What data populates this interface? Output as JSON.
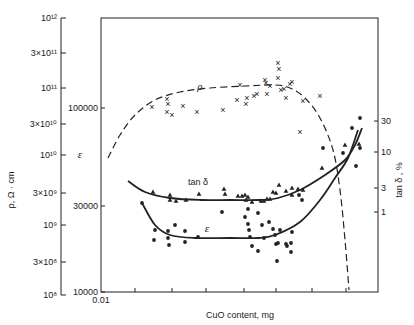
{
  "chart_data": {
    "type": "scatter",
    "title": "",
    "xlabel": "CuO content, mg",
    "x_scale": "log",
    "x_ticks": [
      {
        "label": "0.01",
        "x": 101
      }
    ],
    "axes": {
      "rho": {
        "label": "ρ, Ω · cm",
        "scale": "log",
        "range": [
          100000000.0,
          1000000000000.0
        ],
        "ticks": [
          {
            "label": "10¹²",
            "y": 18
          },
          {
            "label": "3×10¹¹",
            "y": 53
          },
          {
            "label": "10¹¹",
            "y": 88
          },
          {
            "label": "3×10¹⁰",
            "y": 124
          },
          {
            "label": "10¹⁰",
            "y": 155
          },
          {
            "label": "3×10⁹",
            "y": 193
          },
          {
            "label": "10⁹",
            "y": 225
          },
          {
            "label": "3×10⁸",
            "y": 262
          },
          {
            "label": "10⁸",
            "y": 295
          }
        ]
      },
      "epsilon": {
        "label": "ε",
        "scale": "log",
        "range": [
          10000,
          300000
        ],
        "ticks": [
          {
            "label": "100000",
            "y": 108
          },
          {
            "label": "30000",
            "y": 206
          },
          {
            "label": "10000",
            "y": 292
          }
        ]
      },
      "tan_delta": {
        "label": "tan δ , %",
        "scale": "log",
        "ticks": [
          {
            "label": "30",
            "y": 121
          },
          {
            "label": "10",
            "y": 152
          },
          {
            "label": "3",
            "y": 188
          },
          {
            "label": "1",
            "y": 212
          }
        ]
      }
    },
    "series": [
      {
        "name": "ρ",
        "marker": "x",
        "line": "dashed",
        "curve_label": "ρ",
        "curve": [
          [
            108,
            158
          ],
          [
            120,
            135
          ],
          [
            135,
            115
          ],
          [
            155,
            100
          ],
          [
            180,
            92
          ],
          [
            210,
            88
          ],
          [
            245,
            86
          ],
          [
            275,
            85
          ],
          [
            290,
            88
          ],
          [
            305,
            98
          ],
          [
            320,
            118
          ],
          [
            333,
            150
          ],
          [
            340,
            190
          ],
          [
            345,
            240
          ],
          [
            349,
            290
          ]
        ],
        "points": [
          [
            152,
            107
          ],
          [
            167,
            99
          ],
          [
            168,
            104
          ],
          [
            167,
            112
          ],
          [
            172,
            115
          ],
          [
            183,
            106
          ],
          [
            197,
            112
          ],
          [
            223,
            110
          ],
          [
            240,
            85
          ],
          [
            237,
            100
          ],
          [
            247,
            98
          ],
          [
            246,
            104
          ],
          [
            254,
            96
          ],
          [
            257,
            94
          ],
          [
            265,
            80
          ],
          [
            266,
            83
          ],
          [
            267,
            94
          ],
          [
            270,
            86
          ],
          [
            278,
            63
          ],
          [
            279,
            69
          ],
          [
            278,
            78
          ],
          [
            281,
            90
          ],
          [
            284,
            89
          ],
          [
            286,
            98
          ],
          [
            290,
            84
          ],
          [
            292,
            82
          ],
          [
            303,
            101
          ],
          [
            300,
            132
          ],
          [
            320,
            96
          ]
        ]
      },
      {
        "name": "tan δ",
        "marker": "triangle",
        "line": "solid",
        "curve_label": "tan δ",
        "curve": [
          [
            128,
            181
          ],
          [
            145,
            192
          ],
          [
            170,
            198
          ],
          [
            200,
            200
          ],
          [
            230,
            200
          ],
          [
            260,
            200
          ],
          [
            278,
            198
          ],
          [
            300,
            190
          ],
          [
            325,
            175
          ],
          [
            345,
            160
          ],
          [
            355,
            145
          ],
          [
            362,
            128
          ]
        ],
        "points": [
          [
            153,
            192
          ],
          [
            170,
            195
          ],
          [
            170,
            200
          ],
          [
            176,
            201
          ],
          [
            186,
            200
          ],
          [
            199,
            194
          ],
          [
            224,
            189
          ],
          [
            225,
            194
          ],
          [
            238,
            196
          ],
          [
            242,
            196
          ],
          [
            245,
            195
          ],
          [
            248,
            197
          ],
          [
            246,
            200
          ],
          [
            252,
            202
          ],
          [
            261,
            201
          ],
          [
            264,
            201
          ],
          [
            267,
            199
          ],
          [
            270,
            199
          ],
          [
            273,
            192
          ],
          [
            276,
            193
          ],
          [
            279,
            185
          ],
          [
            286,
            191
          ],
          [
            292,
            188
          ],
          [
            292,
            195
          ],
          [
            298,
            189
          ],
          [
            303,
            190
          ],
          [
            322,
            168
          ],
          [
            345,
            145
          ],
          [
            359,
            144
          ]
        ]
      },
      {
        "name": "ε",
        "marker": "dot",
        "line": "solid",
        "curve_label": "ε",
        "curve": [
          [
            142,
            203
          ],
          [
            155,
            225
          ],
          [
            170,
            235
          ],
          [
            195,
            238
          ],
          [
            230,
            238
          ],
          [
            258,
            238
          ],
          [
            275,
            235
          ],
          [
            300,
            222
          ],
          [
            320,
            200
          ],
          [
            335,
            178
          ],
          [
            348,
            158
          ],
          [
            358,
            130
          ]
        ],
        "points": [
          [
            142,
            203
          ],
          [
            155,
            230
          ],
          [
            154,
            240
          ],
          [
            168,
            231
          ],
          [
            168,
            238
          ],
          [
            169,
            245
          ],
          [
            175,
            225
          ],
          [
            185,
            231
          ],
          [
            185,
            242
          ],
          [
            198,
            237
          ],
          [
            222,
            212
          ],
          [
            245,
            217
          ],
          [
            248,
            209
          ],
          [
            248,
            224
          ],
          [
            249,
            230
          ],
          [
            250,
            237
          ],
          [
            252,
            246
          ],
          [
            258,
            251
          ],
          [
            258,
            213
          ],
          [
            262,
            225
          ],
          [
            264,
            238
          ],
          [
            269,
            222
          ],
          [
            273,
            229
          ],
          [
            275,
            235
          ],
          [
            278,
            243
          ],
          [
            280,
            230
          ],
          [
            286,
            244
          ],
          [
            287,
            246
          ],
          [
            291,
            252
          ],
          [
            292,
            232
          ],
          [
            299,
            195
          ],
          [
            302,
            200
          ],
          [
            323,
            148
          ],
          [
            343,
            153
          ],
          [
            352,
            128
          ],
          [
            360,
            118
          ],
          [
            360,
            148
          ],
          [
            356,
            166
          ],
          [
            277,
            261
          ],
          [
            276,
            244
          ],
          [
            291,
            243
          ]
        ]
      }
    ],
    "annotations": [
      {
        "text": "ρ",
        "x": 200,
        "y": 90
      },
      {
        "text": "tan δ",
        "x": 198,
        "y": 185
      },
      {
        "text": "ε",
        "x": 207,
        "y": 232
      },
      {
        "text": "ε",
        "x": 80,
        "y": 158
      }
    ],
    "grid": false,
    "legend": "none"
  }
}
